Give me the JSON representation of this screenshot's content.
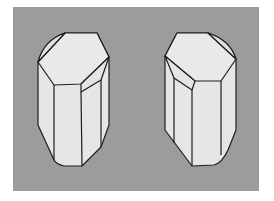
{
  "figure": {
    "title": "Enantiomorphic crystal forms",
    "colors": {
      "page_background": "#ffffff",
      "panel_background": "#9c9c9c",
      "crystal_face": "#e6e6e6",
      "crystal_edge": "#1e1e1e"
    },
    "crystals": [
      {
        "id": "left-crystal",
        "handedness": "left"
      },
      {
        "id": "right-crystal",
        "handedness": "right"
      }
    ]
  }
}
